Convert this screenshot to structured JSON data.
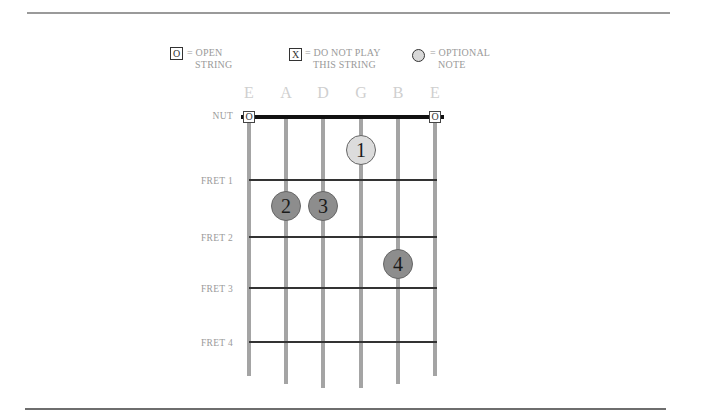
{
  "legend": {
    "open": {
      "symbol": "O",
      "text": "= OPEN\n   STRING"
    },
    "mute": {
      "symbol": "X",
      "text": "= DO NOT PLAY\n   THIS STRING"
    },
    "optional": {
      "text": "= OPTIONAL\n   NOTE"
    }
  },
  "strings": [
    "E",
    "A",
    "D",
    "G",
    "B",
    "E"
  ],
  "fret_labels": {
    "nut": "NUT",
    "fret1": "FRET 1",
    "fret2": "FRET 2",
    "fret3": "FRET 3",
    "fret4": "FRET 4"
  },
  "open_strings": [
    {
      "string": "E (low)",
      "symbol": "O"
    },
    {
      "string": "E (high)",
      "symbol": "O"
    }
  ],
  "fingers": [
    {
      "label": "1",
      "string": "G",
      "fret": 1,
      "optional": true
    },
    {
      "label": "2",
      "string": "A",
      "fret": 2,
      "optional": false
    },
    {
      "label": "3",
      "string": "D",
      "fret": 2,
      "optional": false
    },
    {
      "label": "4",
      "string": "B",
      "fret": 3,
      "optional": false
    }
  ],
  "colors": {
    "finger_fill": "#8d8d8d",
    "optional_fill": "#dcdcdc",
    "string": "#a4a4a4",
    "fret": "#333333",
    "label": "#9a9a9a"
  }
}
